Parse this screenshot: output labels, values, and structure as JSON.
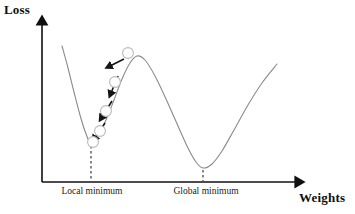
{
  "figure": {
    "width": 355,
    "height": 214,
    "background": "#ffffff"
  },
  "axes": {
    "y_title": "Loss",
    "x_title": "Weights",
    "origin": {
      "x": 42,
      "y": 182
    },
    "y_top": {
      "x": 42,
      "y": 18
    },
    "x_right": {
      "x": 302,
      "y": 182
    },
    "color": "#101010",
    "line_width": 1.6,
    "arrow_heads": [
      "up",
      "right"
    ]
  },
  "labels": {
    "local_minimum": "Local minimum",
    "global_minimum": "Global minimum"
  },
  "chart_data": {
    "type": "line",
    "title": "",
    "xlabel": "Weights",
    "ylabel": "Loss",
    "grid": false,
    "legend": "none",
    "axis_ticks": "none",
    "curve_color": "#8a8a8a",
    "curve_width": 1.1,
    "curve_points": [
      {
        "x": 62,
        "y": 46
      },
      {
        "x": 68,
        "y": 68
      },
      {
        "x": 74,
        "y": 92
      },
      {
        "x": 80,
        "y": 115
      },
      {
        "x": 85,
        "y": 131
      },
      {
        "x": 91,
        "y": 144
      },
      {
        "x": 98,
        "y": 136
      },
      {
        "x": 106,
        "y": 120
      },
      {
        "x": 114,
        "y": 100
      },
      {
        "x": 122,
        "y": 79
      },
      {
        "x": 130,
        "y": 63
      },
      {
        "x": 137,
        "y": 56
      },
      {
        "x": 145,
        "y": 60
      },
      {
        "x": 155,
        "y": 76
      },
      {
        "x": 166,
        "y": 99
      },
      {
        "x": 178,
        "y": 126
      },
      {
        "x": 188,
        "y": 148
      },
      {
        "x": 196,
        "y": 162
      },
      {
        "x": 203,
        "y": 168
      },
      {
        "x": 212,
        "y": 164
      },
      {
        "x": 222,
        "y": 151
      },
      {
        "x": 234,
        "y": 130
      },
      {
        "x": 248,
        "y": 105
      },
      {
        "x": 262,
        "y": 83
      },
      {
        "x": 277,
        "y": 64
      }
    ],
    "annotations": {
      "local_minimum": {
        "x": 91,
        "y": 145,
        "label": "Local minimum"
      },
      "global_minimum": {
        "x": 203,
        "y": 169,
        "label": "Global minimum"
      },
      "local_maximum": {
        "x": 137,
        "y": 56
      }
    },
    "dashed_lines": [
      {
        "name": "local-minimum-dropline",
        "x": 91,
        "y_from": 146,
        "y_to": 181
      },
      {
        "name": "global-minimum-dropline",
        "x": 203,
        "y_from": 170,
        "y_to": 181
      }
    ],
    "balls": {
      "color": "#b9b9b9",
      "fill": "#ffffff",
      "radius": 5.4,
      "positions": [
        {
          "x": 128,
          "y": 53
        },
        {
          "x": 115,
          "y": 82
        },
        {
          "x": 106,
          "y": 111
        },
        {
          "x": 100,
          "y": 131
        },
        {
          "x": 93,
          "y": 142
        }
      ]
    },
    "arrows": {
      "color": "#151515",
      "width": 1.6,
      "segments": [
        {
          "from": {
            "x": 124,
            "y": 59
          },
          "to": {
            "x": 110,
            "y": 66
          }
        },
        {
          "from": {
            "x": 118,
            "y": 76
          },
          "to": {
            "x": 111,
            "y": 93
          }
        },
        {
          "from": {
            "x": 112,
            "y": 101
          },
          "to": {
            "x": 102,
            "y": 117
          }
        },
        {
          "from": {
            "x": 105,
            "y": 123
          },
          "to": {
            "x": 95,
            "y": 138
          }
        }
      ]
    }
  }
}
